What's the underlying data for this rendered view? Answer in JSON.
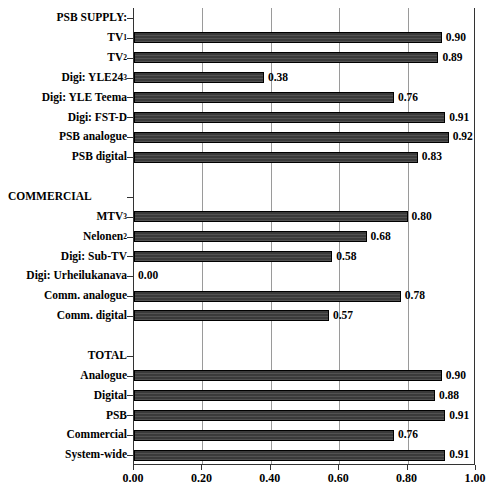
{
  "chart_data": {
    "type": "bar",
    "orientation": "horizontal",
    "title": "",
    "xlabel": "",
    "ylabel": "",
    "xlim": [
      0.0,
      1.0
    ],
    "xticks": [
      "0.00",
      "0.20",
      "0.40",
      "0.60",
      "0.80",
      "1.00"
    ],
    "xtick_values": [
      0.0,
      0.2,
      0.4,
      0.6,
      0.8,
      1.0
    ],
    "grid": true,
    "grid_axis": "x",
    "legend": "none",
    "value_label_format": "0.00",
    "bar_color": "#3a3a3a",
    "bar_edge_color": "#000000",
    "rows": [
      {
        "kind": "section",
        "label": "PSB SUPPLY:",
        "align": "right",
        "value": null
      },
      {
        "kind": "bar",
        "label": "TV",
        "sup": "1",
        "value": 0.9,
        "value_label": "0.90"
      },
      {
        "kind": "bar",
        "label": "TV",
        "sup": "2",
        "value": 0.89,
        "value_label": "0.89"
      },
      {
        "kind": "bar",
        "label": "Digi: YLE24",
        "sup": "3",
        "value": 0.38,
        "value_label": "0.38"
      },
      {
        "kind": "bar",
        "label": "Digi: YLE Teema",
        "sup": "",
        "value": 0.76,
        "value_label": "0.76"
      },
      {
        "kind": "bar",
        "label": "Digi: FST-D",
        "sup": "",
        "value": 0.91,
        "value_label": "0.91"
      },
      {
        "kind": "bar",
        "label": "PSB analogue",
        "sup": "",
        "value": 0.92,
        "value_label": "0.92"
      },
      {
        "kind": "bar",
        "label": "PSB digital",
        "sup": "",
        "value": 0.83,
        "value_label": "0.83"
      },
      {
        "kind": "spacer",
        "label": "",
        "value": null
      },
      {
        "kind": "section",
        "label": "COMMERCIAL",
        "align": "left",
        "value": null
      },
      {
        "kind": "bar",
        "label": "MTV",
        "sup": "3",
        "value": 0.8,
        "value_label": "0.80"
      },
      {
        "kind": "bar",
        "label": "Nelonen",
        "sup": "2",
        "value": 0.68,
        "value_label": "0.68"
      },
      {
        "kind": "bar",
        "label": "Digi: Sub-TV",
        "sup": "",
        "value": 0.58,
        "value_label": "0.58"
      },
      {
        "kind": "bar",
        "label": "Digi: Urheilukanava",
        "sup": "",
        "value": 0.0,
        "value_label": "0.00"
      },
      {
        "kind": "bar",
        "label": "Comm. analogue",
        "sup": "",
        "value": 0.78,
        "value_label": "0.78"
      },
      {
        "kind": "bar",
        "label": "Comm. digital",
        "sup": "",
        "value": 0.57,
        "value_label": "0.57"
      },
      {
        "kind": "spacer",
        "label": "",
        "value": null
      },
      {
        "kind": "section",
        "label": "TOTAL",
        "align": "right",
        "value": null
      },
      {
        "kind": "bar",
        "label": "Analogue",
        "sup": "",
        "value": 0.9,
        "value_label": "0.90"
      },
      {
        "kind": "bar",
        "label": "Digital",
        "sup": "",
        "value": 0.88,
        "value_label": "0.88"
      },
      {
        "kind": "bar",
        "label": "PSB",
        "sup": "",
        "value": 0.91,
        "value_label": "0.91"
      },
      {
        "kind": "bar",
        "label": "Commercial",
        "sup": "",
        "value": 0.76,
        "value_label": "0.76"
      },
      {
        "kind": "bar",
        "label": "System-wide",
        "sup": "",
        "value": 0.91,
        "value_label": "0.91"
      }
    ]
  }
}
